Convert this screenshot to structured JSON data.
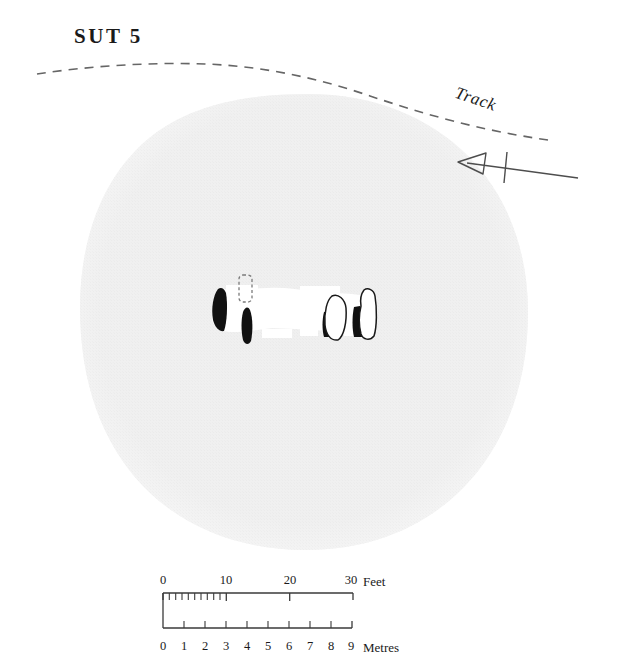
{
  "plan": {
    "title": "SUT 5",
    "track_label": "Track",
    "north_arrow_name": "north-arrow",
    "colors": {
      "cairn_fill": "#efefef",
      "chamber_fill": "#ffffff",
      "orthostat_fill": "#111111",
      "stone_outline": "#1a1a1a",
      "line": "#555555",
      "text": "#1a1a1a"
    }
  },
  "scale_bar": {
    "feet": {
      "unit_label": "Feet",
      "ticks": [
        {
          "label": "0",
          "value": 0
        },
        {
          "label": "10",
          "value": 10
        },
        {
          "label": "20",
          "value": 20
        },
        {
          "label": "30",
          "value": 30
        }
      ],
      "minor_tick_interval": 1,
      "minor_tick_range": [
        0,
        10
      ],
      "max": 30
    },
    "metres": {
      "unit_label": "Metres",
      "ticks": [
        {
          "label": "0",
          "value": 0
        },
        {
          "label": "1",
          "value": 1
        },
        {
          "label": "2",
          "value": 2
        },
        {
          "label": "3",
          "value": 3
        },
        {
          "label": "4",
          "value": 4
        },
        {
          "label": "5",
          "value": 5
        },
        {
          "label": "6",
          "value": 6
        },
        {
          "label": "7",
          "value": 7
        },
        {
          "label": "8",
          "value": 8
        },
        {
          "label": "9",
          "value": 9
        }
      ],
      "max": 9
    }
  },
  "features": {
    "cairn": "cairn-mound",
    "chamber": "chamber-outline",
    "conjectured_stone": "dashed-stone-setting",
    "orthostats_filled": 4,
    "orthostats_outlined": 2
  }
}
